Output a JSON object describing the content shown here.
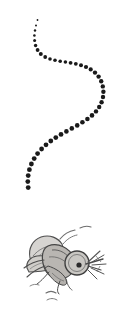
{
  "illustration": {
    "title": "Mosquito flight path",
    "caption": "A dotted S-shaped flight trail descending to a hand-drawn mosquito",
    "style": "pencil sketch, greyscale",
    "canvas": {
      "width": 136,
      "height": 317,
      "background": "#ffffff"
    },
    "colors": {
      "background": "#ffffff",
      "trail_dot": "#1a1a1a",
      "sketch_outline": "#4a4a4a",
      "sketch_dark": "#3a3a3a",
      "body_fill": "#b8b5b2",
      "wing_fill": "#d3d1ce",
      "head_fill": "#c9c7c4",
      "eye_pupil": "#2b2b2b",
      "motion_line": "#6a6a6a"
    }
  },
  "trail": {
    "name": "dotted-flight-path",
    "dot_count": 45,
    "description": "Dots grow in size from the small start at top toward the insect at bottom",
    "dots": [
      {
        "cx": 37.5,
        "cy": 20.0,
        "r": 0.9
      },
      {
        "cx": 36.0,
        "cy": 25.5,
        "r": 1.0
      },
      {
        "cx": 35.0,
        "cy": 30.5,
        "r": 1.2
      },
      {
        "cx": 34.4,
        "cy": 35.5,
        "r": 1.3
      },
      {
        "cx": 34.6,
        "cy": 40.5,
        "r": 1.5
      },
      {
        "cx": 35.6,
        "cy": 45.5,
        "r": 1.7
      },
      {
        "cx": 37.6,
        "cy": 50.0,
        "r": 1.9
      },
      {
        "cx": 40.8,
        "cy": 54.0,
        "r": 2.0
      },
      {
        "cx": 45.2,
        "cy": 57.0,
        "r": 1.9
      },
      {
        "cx": 50.0,
        "cy": 59.0,
        "r": 1.8
      },
      {
        "cx": 55.0,
        "cy": 60.3,
        "r": 1.8
      },
      {
        "cx": 60.2,
        "cy": 61.2,
        "r": 1.8
      },
      {
        "cx": 65.4,
        "cy": 62.0,
        "r": 1.8
      },
      {
        "cx": 70.6,
        "cy": 62.8,
        "r": 1.9
      },
      {
        "cx": 75.8,
        "cy": 63.8,
        "r": 1.9
      },
      {
        "cx": 81.0,
        "cy": 65.2,
        "r": 2.0
      },
      {
        "cx": 86.0,
        "cy": 67.0,
        "r": 2.1
      },
      {
        "cx": 90.7,
        "cy": 69.4,
        "r": 2.1
      },
      {
        "cx": 95.0,
        "cy": 72.6,
        "r": 2.2
      },
      {
        "cx": 98.6,
        "cy": 76.6,
        "r": 2.2
      },
      {
        "cx": 101.2,
        "cy": 81.3,
        "r": 2.2
      },
      {
        "cx": 102.8,
        "cy": 86.4,
        "r": 2.2
      },
      {
        "cx": 103.4,
        "cy": 91.7,
        "r": 2.2
      },
      {
        "cx": 103.0,
        "cy": 97.0,
        "r": 2.2
      },
      {
        "cx": 101.6,
        "cy": 102.2,
        "r": 2.2
      },
      {
        "cx": 99.2,
        "cy": 107.0,
        "r": 2.2
      },
      {
        "cx": 96.0,
        "cy": 111.4,
        "r": 2.2
      },
      {
        "cx": 92.0,
        "cy": 115.4,
        "r": 2.3
      },
      {
        "cx": 87.4,
        "cy": 119.0,
        "r": 2.3
      },
      {
        "cx": 82.4,
        "cy": 122.3,
        "r": 2.3
      },
      {
        "cx": 77.2,
        "cy": 125.4,
        "r": 2.3
      },
      {
        "cx": 71.8,
        "cy": 128.4,
        "r": 2.3
      },
      {
        "cx": 66.4,
        "cy": 131.4,
        "r": 2.3
      },
      {
        "cx": 61.0,
        "cy": 134.4,
        "r": 2.4
      },
      {
        "cx": 55.8,
        "cy": 137.6,
        "r": 2.4
      },
      {
        "cx": 50.8,
        "cy": 141.0,
        "r": 2.4
      },
      {
        "cx": 46.0,
        "cy": 144.8,
        "r": 2.4
      },
      {
        "cx": 41.6,
        "cy": 149.0,
        "r": 2.4
      },
      {
        "cx": 37.6,
        "cy": 153.6,
        "r": 2.4
      },
      {
        "cx": 34.2,
        "cy": 158.6,
        "r": 2.4
      },
      {
        "cx": 31.4,
        "cy": 164.0,
        "r": 2.4
      },
      {
        "cx": 29.4,
        "cy": 169.7,
        "r": 2.4
      },
      {
        "cx": 28.2,
        "cy": 175.6,
        "r": 2.4
      },
      {
        "cx": 27.8,
        "cy": 181.6,
        "r": 2.4
      },
      {
        "cx": 28.2,
        "cy": 187.6,
        "r": 2.4
      }
    ]
  },
  "insect": {
    "name": "mosquito",
    "label": "Mosquito",
    "parts": [
      {
        "name": "upper-wing",
        "label": "Upper wing"
      },
      {
        "name": "lower-wing",
        "label": "Lower wing"
      },
      {
        "name": "thorax",
        "label": "Thorax"
      },
      {
        "name": "abdomen",
        "label": "Abdomen"
      },
      {
        "name": "head",
        "label": "Head"
      },
      {
        "name": "eye",
        "label": "Eye"
      },
      {
        "name": "proboscis",
        "label": "Proboscis"
      },
      {
        "name": "antennae",
        "label": "Antennae"
      },
      {
        "name": "legs",
        "label": "Legs"
      }
    ],
    "position": {
      "x": 22,
      "y": 232,
      "width": 80,
      "height": 70
    }
  },
  "motion_lines": {
    "name": "motion-lines",
    "label": "Buzzing motion lines",
    "count": 6
  }
}
